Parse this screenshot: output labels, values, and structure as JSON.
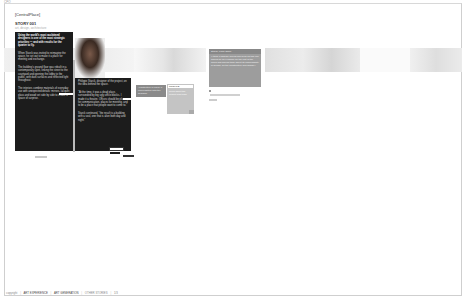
{
  "window": {
    "tab_label": "CPO"
  },
  "header": {
    "brand": "[CentralPlace]",
    "story_title": "STORY 001",
    "subtitle": "art, design, architecture"
  },
  "column1": {
    "lead": "Using the world's most acclaimed designers is one of the most strategic priorities — and with results for the quarter to fly.",
    "paragraphs": [
      "When Starck was invited to reimagine the space, he set out to make it a place for meeting and exchange.",
      "The building's ground floor was rebuilt in a contemporary spirit, linking the street to the courtyard and opening the lobby to the public, with dark surfaces and reflected light throughout.",
      "The interiors combine materials of everyday use with unexpected details: mirrors, lacquer, glass and wood set side by side to create a space of surprise."
    ],
    "caption": "photo credit"
  },
  "column2": {
    "intro": "Philippe Starck, designer of the project, on the idea behind the space.",
    "paragraphs": [
      "\"At the time, it was a dead place, surrounded by big ugly office blocks. I made it a theatre. Offices should be places for communication, places for meeting, and to be a place that people want to come to.\"",
      "Starck continued, \"the result is a building with a soul, one that is alive both day and night.\""
    ],
    "links": [
      "read more",
      "next",
      "previous"
    ]
  },
  "cards": {
    "dark_card": "Architecture in Paris: a conversation with the designer",
    "light_card_title": "PROFILE",
    "light_card_text": "Read about the project and team"
  },
  "quote_box": {
    "title": "Starck, Paris Office",
    "text": "\"I think a globally-sound firm such as this one should be an example for the rest of the world and should think about its responsibility in design, for the architecture and design.\"",
    "links": [
      "—",
      "Download the full interview",
      "PDF 1.2MB"
    ]
  },
  "footer": {
    "items": [
      "copyright",
      "ART EXPERIENCE",
      "ART GENERATION",
      "OTHER STORIES",
      "1/3"
    ]
  }
}
